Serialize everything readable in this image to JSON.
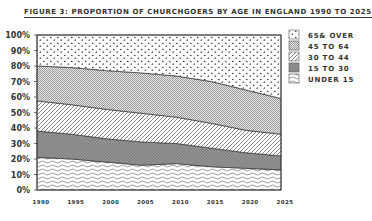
{
  "chart_data": {
    "type": "area",
    "stacked": true,
    "title": "Figure 3: Proportion of churchgoers by age in England 1990 to 2025",
    "xlabel": "",
    "ylabel": "",
    "x": [
      1990,
      1995,
      2000,
      2005,
      2010,
      2015,
      2020,
      2025
    ],
    "x_tick_labels": [
      "1990",
      "1995",
      "2000",
      "2005",
      "2010",
      "2015",
      "2020",
      "2025"
    ],
    "y_tick_labels": [
      "100%",
      "90%",
      "80%",
      "70%",
      "60%",
      "50%",
      "40%",
      "30%",
      "20%",
      "10%",
      "0%"
    ],
    "ylim": [
      0,
      100
    ],
    "grid": false,
    "legend_position": "right",
    "series": [
      {
        "name": "Under 15",
        "pattern": "waves",
        "values": [
          21,
          20,
          18,
          16,
          17,
          15,
          14,
          13
        ]
      },
      {
        "name": "15 to 30",
        "pattern": "dark-crosshatch",
        "values": [
          17,
          16,
          15,
          15,
          13,
          12,
          10,
          9
        ]
      },
      {
        "name": "30 to 44",
        "pattern": "diagonal-lines",
        "values": [
          19.5,
          19,
          19,
          18.5,
          17,
          16,
          14.5,
          14
        ]
      },
      {
        "name": "45 to 64",
        "pattern": "fine-checker",
        "values": [
          22.5,
          24,
          25,
          26,
          26.5,
          27,
          26,
          23
        ]
      },
      {
        "name": "65 & over",
        "pattern": "dots",
        "values": [
          20,
          21,
          23,
          24.5,
          26.5,
          30,
          35.5,
          41
        ]
      }
    ]
  },
  "legend": {
    "items": [
      {
        "label": "65& over"
      },
      {
        "label": "45 to 64"
      },
      {
        "label": "30 to 44"
      },
      {
        "label": "15 to 30"
      },
      {
        "label": "Under 15"
      }
    ]
  },
  "title": "Figure 3: Proportion of churchgoers by age in England 1990 to 2025"
}
